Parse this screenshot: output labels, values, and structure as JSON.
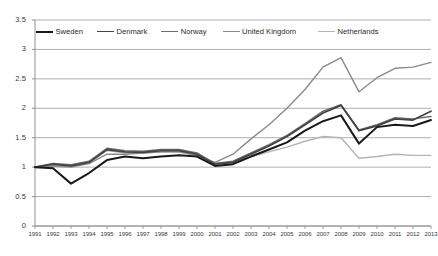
{
  "chart_data": {
    "type": "line",
    "title": "",
    "xlabel": "",
    "ylabel": "",
    "xlim": [
      1991,
      2013
    ],
    "ylim": [
      0,
      3.5
    ],
    "ytick_step": 0.5,
    "grid": true,
    "legend_position": "top-left-inside",
    "x": [
      1991,
      1992,
      1993,
      1994,
      1995,
      1996,
      1997,
      1998,
      1999,
      2000,
      2001,
      2002,
      2003,
      2004,
      2005,
      2006,
      2007,
      2008,
      2009,
      2010,
      2011,
      2012,
      2013
    ],
    "yticks": [
      "0",
      "0.5",
      "1",
      "1.5",
      "2",
      "2.5",
      "3",
      "3.5"
    ],
    "xticks": [
      "1991",
      "1992",
      "1993",
      "1994",
      "1995",
      "1996",
      "1997",
      "1998",
      "1999",
      "2000",
      "2001",
      "2002",
      "2003",
      "2004",
      "2005",
      "2006",
      "2007",
      "2008",
      "2009",
      "2010",
      "2011",
      "2012",
      "2013"
    ],
    "series": [
      {
        "name": "Sweden",
        "color": "#1a1a1a",
        "width": 2.0,
        "values": [
          1.0,
          0.98,
          0.72,
          0.9,
          1.12,
          1.18,
          1.15,
          1.18,
          1.2,
          1.18,
          1.02,
          1.05,
          1.18,
          1.3,
          1.42,
          1.62,
          1.78,
          1.88,
          1.4,
          1.68,
          1.72,
          1.7,
          1.8
        ]
      },
      {
        "name": "Denmark",
        "color": "#444444",
        "width": 1.8,
        "values": [
          1.0,
          1.05,
          1.02,
          1.08,
          1.3,
          1.26,
          1.25,
          1.28,
          1.28,
          1.22,
          1.05,
          1.08,
          1.22,
          1.36,
          1.52,
          1.72,
          1.92,
          2.05,
          1.62,
          1.7,
          1.82,
          1.8,
          1.95
        ]
      },
      {
        "name": "Norway",
        "color": "#6e6e6e",
        "width": 1.5,
        "values": [
          1.0,
          1.06,
          1.04,
          1.1,
          1.32,
          1.28,
          1.27,
          1.3,
          1.3,
          1.24,
          1.06,
          1.1,
          1.24,
          1.38,
          1.54,
          1.74,
          1.95,
          2.06,
          1.63,
          1.72,
          1.84,
          1.82,
          1.86
        ]
      },
      {
        "name": "United Kingdom",
        "color": "#8a8a8a",
        "width": 1.4,
        "values": [
          1.0,
          1.02,
          1.0,
          1.06,
          1.22,
          1.22,
          1.24,
          1.26,
          1.26,
          1.2,
          1.08,
          1.22,
          1.48,
          1.72,
          2.0,
          2.32,
          2.7,
          2.86,
          2.28,
          2.52,
          2.68,
          2.7,
          2.78
        ]
      },
      {
        "name": "Netherlands",
        "color": "#b4b4b4",
        "width": 1.4,
        "values": [
          1.0,
          1.04,
          1.02,
          1.08,
          1.28,
          1.24,
          1.24,
          1.26,
          1.26,
          1.2,
          1.05,
          1.08,
          1.18,
          1.26,
          1.34,
          1.44,
          1.52,
          1.5,
          1.15,
          1.18,
          1.22,
          1.2,
          1.2
        ]
      }
    ]
  },
  "legend": {
    "items": [
      {
        "label": "Sweden"
      },
      {
        "label": "Denmark"
      },
      {
        "label": "Norway"
      },
      {
        "label": "United Kingdom"
      },
      {
        "label": "Netherlands"
      }
    ]
  },
  "axes": {
    "frame_color": "#888888",
    "grid_color": "#9a9a9a"
  }
}
